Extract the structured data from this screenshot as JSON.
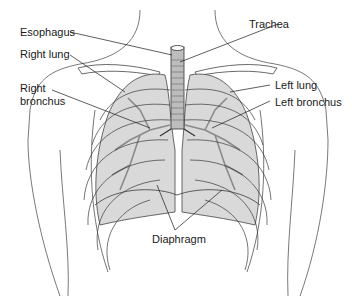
{
  "diagram": {
    "labels": {
      "esophagus": "Esophagus",
      "trachea": "Trachea",
      "right_lung": "Right lung",
      "left_lung": "Left lung",
      "right_bronchus_line1": "Right",
      "right_bronchus_line2": "bronchus",
      "left_bronchus": "Left bronchus",
      "diaphragm": "Diaphragm"
    },
    "colors": {
      "lung_fill": "#d9d9d9",
      "lung_shade": "#c4c4c4",
      "outline": "#3a3a3a",
      "bronchi": "#8a8a8a",
      "background": "#ffffff"
    }
  }
}
